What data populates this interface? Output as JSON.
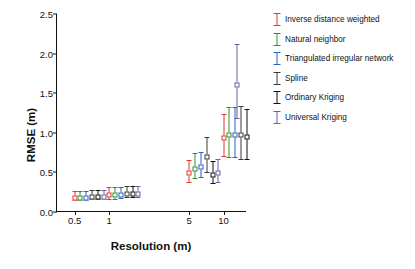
{
  "chart_data": {
    "type": "scatter",
    "title": "",
    "xlabel": "Resolution (m)",
    "ylabel": "RMSE (m)",
    "xscale": "log",
    "xlim": [
      0.35,
      16
    ],
    "ylim": [
      0.0,
      2.5
    ],
    "yticks": [
      "0.0",
      "0.5",
      "1.0",
      "1.5",
      "2.0",
      "2.5"
    ],
    "ytick_values": [
      0.0,
      0.5,
      1.0,
      1.5,
      2.0,
      2.5
    ],
    "xticks": [
      "0.5",
      "1",
      "5",
      "10"
    ],
    "xtick_values": [
      0.5,
      1,
      5,
      10
    ],
    "grid": false,
    "legend_position": "right",
    "series": [
      {
        "name": "Inverse distance weighted",
        "color": "#e8352a",
        "x": [
          0.5,
          1,
          5,
          10
        ],
        "values": [
          0.21,
          0.24,
          0.52,
          0.97
        ],
        "err_low": [
          0.06,
          0.07,
          0.14,
          0.26
        ],
        "err_high": [
          0.06,
          0.07,
          0.14,
          0.27
        ]
      },
      {
        "name": "Natural neighbor",
        "color": "#2f8f2f",
        "x": [
          0.56,
          1.13,
          5.6,
          11.2
        ],
        "values": [
          0.21,
          0.24,
          0.58,
          1.0
        ],
        "err_low": [
          0.06,
          0.07,
          0.15,
          0.3
        ],
        "err_high": [
          0.06,
          0.07,
          0.16,
          0.32
        ]
      },
      {
        "name": "Triangulated irregular network",
        "color": "#2b62c8",
        "x": [
          0.63,
          1.27,
          6.3,
          12.6
        ],
        "values": [
          0.21,
          0.25,
          0.6,
          1.0
        ],
        "err_low": [
          0.06,
          0.07,
          0.16,
          0.3
        ],
        "err_high": [
          0.06,
          0.07,
          0.16,
          0.32
        ]
      },
      {
        "name": "Spline",
        "color": "#3a3a3a",
        "x": [
          0.71,
          1.43,
          7.1,
          14.2
        ],
        "values": [
          0.22,
          0.26,
          0.72,
          1.0
        ],
        "err_low": [
          0.06,
          0.07,
          0.22,
          0.33
        ],
        "err_high": [
          0.06,
          0.07,
          0.23,
          0.34
        ]
      },
      {
        "name": "Ordinary Kriging",
        "color": "#111111",
        "x": [
          0.8,
          1.6,
          8.0,
          16.0
        ],
        "values": [
          0.22,
          0.26,
          0.5,
          0.98
        ],
        "err_low": [
          0.06,
          0.07,
          0.13,
          0.31
        ],
        "err_high": [
          0.06,
          0.07,
          0.14,
          0.32
        ]
      },
      {
        "name": "Universal Kriging",
        "color": "#6b5fa8",
        "x": [
          0.9,
          1.8,
          9.0,
          13.0
        ],
        "values": [
          0.22,
          0.26,
          0.52,
          1.64
        ],
        "err_low": [
          0.06,
          0.07,
          0.14,
          0.45
        ],
        "err_high": [
          0.06,
          0.07,
          0.15,
          0.48
        ]
      }
    ]
  }
}
